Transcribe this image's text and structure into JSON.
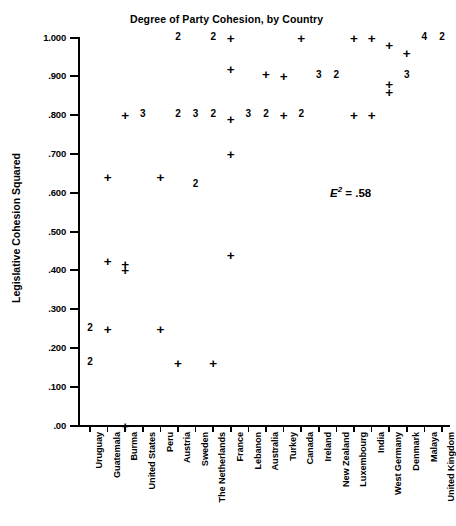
{
  "chart_data": {
    "type": "scatter",
    "title": "Degree of Party Cohesion, by Country",
    "xlabel": "",
    "ylabel": "Legislative Cohesion Squared",
    "ylim": [
      0.0,
      1.0
    ],
    "grid": false,
    "legend": null,
    "annotations": [
      {
        "text_prefix": "E",
        "text_sup": "2",
        "text_suffix": " = .58",
        "value": 0.58
      }
    ],
    "ytick_labels": [
      "1.000",
      ".900",
      ".800",
      ".700",
      ".600",
      ".500",
      ".400",
      ".300",
      ".200",
      ".100",
      ".00"
    ],
    "ytick_values": [
      1.0,
      0.9,
      0.8,
      0.7,
      0.6,
      0.5,
      0.4,
      0.3,
      0.2,
      0.1,
      0.0
    ],
    "categories": [
      "Uruguay",
      "Guatemala",
      "Burma",
      "United States",
      "Peru",
      "Austria",
      "Sweden",
      "The Netherlands",
      "France",
      "Lebanon",
      "Australia",
      "Turkey",
      "Canada",
      "Ireland",
      "New Zealand",
      "Luxembourg",
      "India",
      "West Germany",
      "Denmark",
      "Malaya",
      "United Kingdom"
    ],
    "note": "Marker glyph '+' = one case; a digit glyph = that many overlapping cases at the point.",
    "points": [
      {
        "country": "Uruguay",
        "x": 0,
        "y": 0.25,
        "marker": "2",
        "count": 2
      },
      {
        "country": "Uruguay",
        "x": 0,
        "y": 0.16,
        "marker": "2",
        "count": 2
      },
      {
        "country": "Guatemala",
        "x": 1,
        "y": 0.64,
        "marker": "+",
        "count": 1
      },
      {
        "country": "Guatemala",
        "x": 1,
        "y": 0.425,
        "marker": "+",
        "count": 1
      },
      {
        "country": "Guatemala",
        "x": 1,
        "y": 0.25,
        "marker": "+",
        "count": 1
      },
      {
        "country": "Burma",
        "x": 2,
        "y": 0.8,
        "marker": "+",
        "count": 1
      },
      {
        "country": "Burma",
        "x": 2,
        "y": 0.415,
        "marker": "+",
        "count": 1
      },
      {
        "country": "Burma",
        "x": 2,
        "y": 0.4,
        "marker": "+",
        "count": 1
      },
      {
        "country": "Burma",
        "x": 2,
        "y": 0.0,
        "marker": "+",
        "count": 1
      },
      {
        "country": "United States",
        "x": 3,
        "y": 0.8,
        "marker": "3",
        "count": 3
      },
      {
        "country": "Peru",
        "x": 4,
        "y": 0.64,
        "marker": "+",
        "count": 1
      },
      {
        "country": "Peru",
        "x": 4,
        "y": 0.25,
        "marker": "+",
        "count": 1
      },
      {
        "country": "Austria",
        "x": 5,
        "y": 1.0,
        "marker": "2",
        "count": 2
      },
      {
        "country": "Austria",
        "x": 5,
        "y": 0.8,
        "marker": "2",
        "count": 2
      },
      {
        "country": "Austria",
        "x": 5,
        "y": 0.16,
        "marker": "+",
        "count": 1
      },
      {
        "country": "Sweden",
        "x": 6,
        "y": 0.8,
        "marker": "3",
        "count": 3
      },
      {
        "country": "Sweden",
        "x": 6,
        "y": 0.62,
        "marker": "2",
        "count": 2
      },
      {
        "country": "The Netherlands",
        "x": 7,
        "y": 1.0,
        "marker": "2",
        "count": 2
      },
      {
        "country": "The Netherlands",
        "x": 7,
        "y": 0.8,
        "marker": "2",
        "count": 2
      },
      {
        "country": "The Netherlands",
        "x": 7,
        "y": 0.16,
        "marker": "+",
        "count": 1
      },
      {
        "country": "France",
        "x": 8,
        "y": 1.0,
        "marker": "+",
        "count": 1
      },
      {
        "country": "France",
        "x": 8,
        "y": 0.92,
        "marker": "+",
        "count": 1
      },
      {
        "country": "France",
        "x": 8,
        "y": 0.79,
        "marker": "+",
        "count": 1
      },
      {
        "country": "France",
        "x": 8,
        "y": 0.7,
        "marker": "+",
        "count": 1
      },
      {
        "country": "France",
        "x": 8,
        "y": 0.44,
        "marker": "+",
        "count": 1
      },
      {
        "country": "Lebanon",
        "x": 9,
        "y": 0.8,
        "marker": "3",
        "count": 3
      },
      {
        "country": "Australia",
        "x": 10,
        "y": 0.905,
        "marker": "+",
        "count": 1
      },
      {
        "country": "Australia",
        "x": 10,
        "y": 0.8,
        "marker": "2",
        "count": 2
      },
      {
        "country": "Turkey",
        "x": 11,
        "y": 0.9,
        "marker": "+",
        "count": 1
      },
      {
        "country": "Turkey",
        "x": 11,
        "y": 0.8,
        "marker": "+",
        "count": 1
      },
      {
        "country": "Canada",
        "x": 12,
        "y": 1.0,
        "marker": "+",
        "count": 1
      },
      {
        "country": "Canada",
        "x": 12,
        "y": 0.8,
        "marker": "2",
        "count": 2
      },
      {
        "country": "Ireland",
        "x": 13,
        "y": 0.9,
        "marker": "3",
        "count": 3
      },
      {
        "country": "New Zealand",
        "x": 14,
        "y": 0.9,
        "marker": "2",
        "count": 2
      },
      {
        "country": "Luxembourg",
        "x": 15,
        "y": 1.0,
        "marker": "+",
        "count": 1
      },
      {
        "country": "Luxembourg",
        "x": 15,
        "y": 0.8,
        "marker": "+",
        "count": 1
      },
      {
        "country": "India",
        "x": 16,
        "y": 1.0,
        "marker": "+",
        "count": 1
      },
      {
        "country": "India",
        "x": 16,
        "y": 0.8,
        "marker": "+",
        "count": 1
      },
      {
        "country": "West Germany",
        "x": 17,
        "y": 0.98,
        "marker": "+",
        "count": 1
      },
      {
        "country": "West Germany",
        "x": 17,
        "y": 0.88,
        "marker": "+",
        "count": 1
      },
      {
        "country": "West Germany",
        "x": 17,
        "y": 0.86,
        "marker": "+",
        "count": 1
      },
      {
        "country": "Denmark",
        "x": 18,
        "y": 0.96,
        "marker": "+",
        "count": 1
      },
      {
        "country": "Denmark",
        "x": 18,
        "y": 0.9,
        "marker": "3",
        "count": 3
      },
      {
        "country": "Malaya",
        "x": 19,
        "y": 1.0,
        "marker": "4",
        "count": 4
      },
      {
        "country": "United Kingdom",
        "x": 20,
        "y": 1.0,
        "marker": "2",
        "count": 2
      }
    ]
  }
}
